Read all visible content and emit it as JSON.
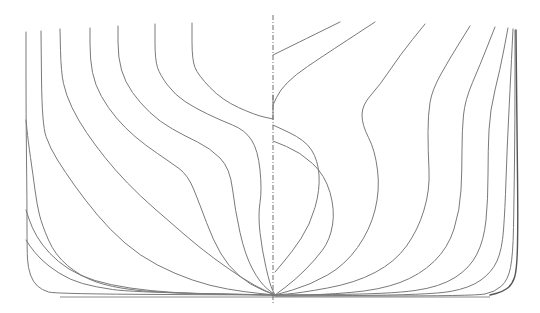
{
  "diagram": {
    "type": "ship-body-plan",
    "line_color": "#7a7a7a",
    "centerline_color": "#6e6e6e",
    "background": "#ffffff",
    "halves": [
      {
        "side": "left",
        "name": "aft-body",
        "station_count": 11
      },
      {
        "side": "right",
        "name": "fore-body",
        "station_count": 11
      }
    ],
    "centerline": {
      "style": "dash-dot"
    },
    "labels": []
  }
}
